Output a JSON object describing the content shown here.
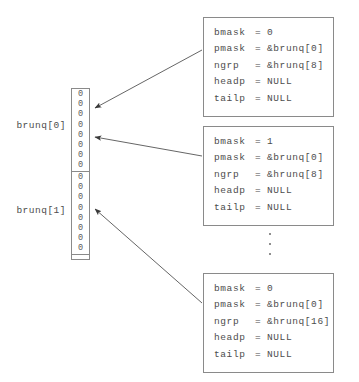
{
  "diagram": {
    "colors": {
      "background": "#ffffff",
      "stroke": "#8a8a8a",
      "text": "#4d4d4d",
      "arrow": "#555555"
    }
  },
  "array": {
    "cell_value": "0",
    "groups": [
      {
        "label": "brunq[0]",
        "cells": [
          "0",
          "0",
          "0",
          "0",
          "0",
          "0",
          "0",
          "0"
        ]
      },
      {
        "label": "brunq[1]",
        "cells": [
          "0",
          "0",
          "0",
          "0",
          "0",
          "0",
          "0",
          "0"
        ]
      }
    ]
  },
  "structs": [
    {
      "id": "struct-top",
      "fields": [
        {
          "name": "bmask",
          "eq": "=",
          "value": "0"
        },
        {
          "name": "pmask",
          "eq": "=",
          "value": "&brunq[0]"
        },
        {
          "name": "ngrp",
          "eq": "=",
          "value": "&hrunq[8]"
        },
        {
          "name": "headp",
          "eq": "=",
          "value": "NULL"
        },
        {
          "name": "tailp",
          "eq": "=",
          "value": "NULL"
        }
      ]
    },
    {
      "id": "struct-middle",
      "fields": [
        {
          "name": "bmask",
          "eq": "=",
          "value": "1"
        },
        {
          "name": "pmask",
          "eq": "=",
          "value": "&brunq[0]"
        },
        {
          "name": "ngrp",
          "eq": "=",
          "value": "&hrunq[8]"
        },
        {
          "name": "headp",
          "eq": "=",
          "value": "NULL"
        },
        {
          "name": "tailp",
          "eq": "=",
          "value": "NULL"
        }
      ]
    },
    {
      "id": "struct-bottom",
      "fields": [
        {
          "name": "bmask",
          "eq": "=",
          "value": "0"
        },
        {
          "name": "pmask",
          "eq": "=",
          "value": "&brunq[0]"
        },
        {
          "name": "ngrp",
          "eq": "=",
          "value": "&hrunq[16]"
        },
        {
          "name": "headp",
          "eq": "=",
          "value": "NULL"
        },
        {
          "name": "tailp",
          "eq": "=",
          "value": "NULL"
        }
      ]
    }
  ],
  "ellipsis": {
    "dot_count": 3
  }
}
